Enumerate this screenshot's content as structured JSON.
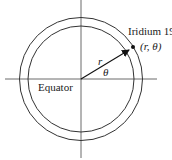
{
  "diagram": {
    "satellite_name": "Iridium 19",
    "coordinates": "(r, θ)",
    "radius_label": "r",
    "angle_label": "θ",
    "equator_label": "Equator"
  }
}
